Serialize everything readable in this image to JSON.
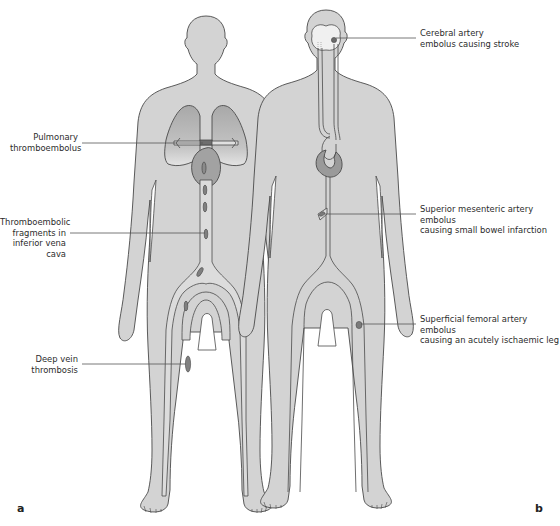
{
  "figure": {
    "colors": {
      "body_fill": "#d3d3d3",
      "outline": "#4a4a4a",
      "lung_fill": "#b8b8b8",
      "heart_fill": "#9a9a9a",
      "clot_fill": "#8a8a8a",
      "vessel_fill": "#e2e2e2",
      "leader_line": "#555555"
    },
    "panels": [
      {
        "id": "a",
        "letter": "a",
        "labels": [
          {
            "text_line1": "Pulmonary",
            "text_line2": "thromboembolus",
            "text_line3": ""
          },
          {
            "text_line1": "Thromboembolic",
            "text_line2": "fragments in",
            "text_line3": "inferior vena cava"
          },
          {
            "text_line1": "Deep vein",
            "text_line2": "thrombosis",
            "text_line3": ""
          }
        ]
      },
      {
        "id": "b",
        "letter": "b",
        "labels": [
          {
            "text_line1": "Cerebral artery",
            "text_line2": "embolus causing stroke"
          },
          {
            "text_line1": "Superior mesenteric artery embolus",
            "text_line2": "causing small bowel infarction"
          },
          {
            "text_line1": "Superficial femoral artery embolus",
            "text_line2": "causing an acutely ischaemic leg"
          }
        ]
      }
    ]
  }
}
